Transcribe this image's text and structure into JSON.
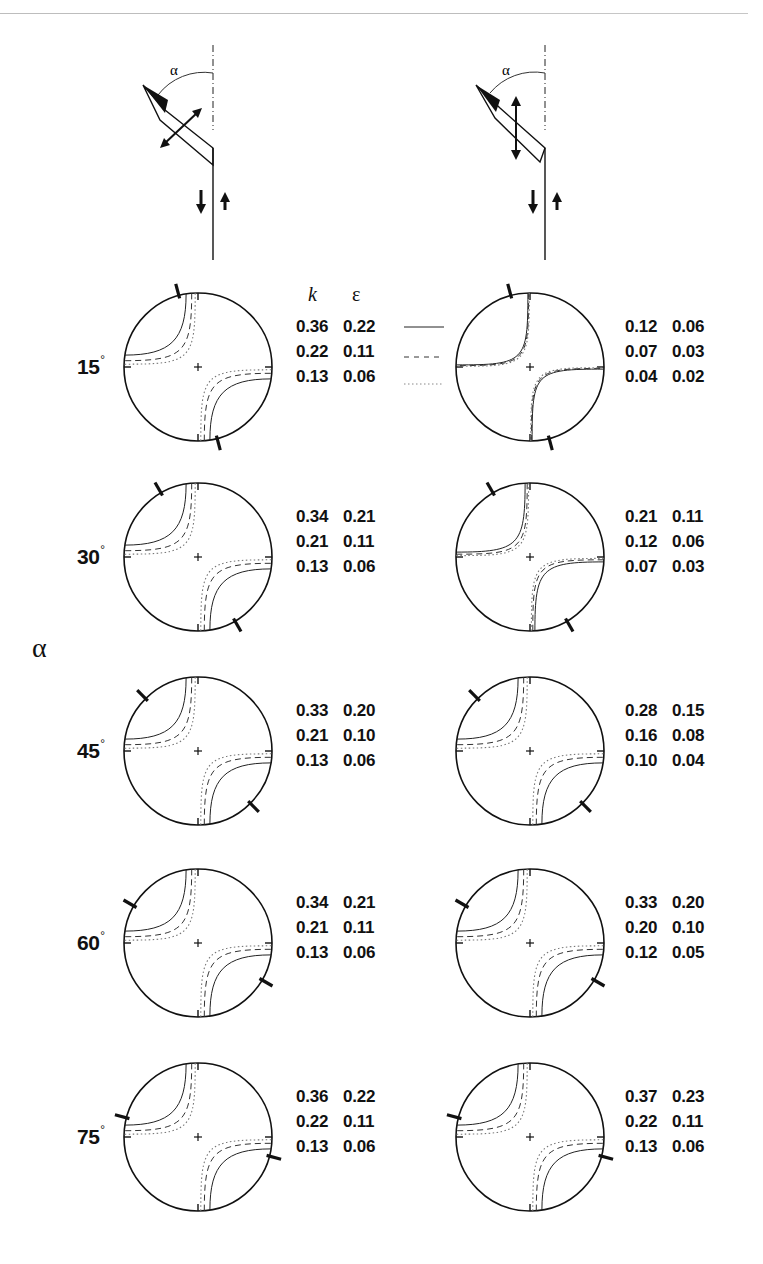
{
  "page": {
    "axis_label": "α",
    "column_headers": {
      "k": "k",
      "epsilon": "ε"
    },
    "legend": [
      {
        "style": "solid",
        "label": "solid line"
      },
      {
        "style": "dashed",
        "label": "dashed line"
      },
      {
        "style": "dotted",
        "label": "dotted line"
      }
    ]
  },
  "schematics": {
    "left": {
      "angle_symbol": "α",
      "description": "inclined fault segment with arrows perpendicular to segment (opening)",
      "arrow_mode": "perpendicular"
    },
    "right": {
      "angle_symbol": "α",
      "description": "inclined fault segment with vertical arrows",
      "arrow_mode": "vertical"
    }
  },
  "chart_data": {
    "type": "table",
    "title": "",
    "row_axis_label": "α",
    "columns": [
      "k",
      "ε"
    ],
    "line_styles": [
      "solid",
      "dashed",
      "dotted"
    ],
    "rows": [
      {
        "angle": "15°",
        "left": [
          [
            "0.36",
            "0.22"
          ],
          [
            "0.22",
            "0.11"
          ],
          [
            "0.13",
            "0.06"
          ]
        ],
        "right": [
          [
            "0.12",
            "0.06"
          ],
          [
            "0.07",
            "0.03"
          ],
          [
            "0.04",
            "0.02"
          ]
        ],
        "left_marker_deg": 15,
        "right_marker_deg": 15
      },
      {
        "angle": "30°",
        "left": [
          [
            "0.34",
            "0.21"
          ],
          [
            "0.21",
            "0.11"
          ],
          [
            "0.13",
            "0.06"
          ]
        ],
        "right": [
          [
            "0.21",
            "0.11"
          ],
          [
            "0.12",
            "0.06"
          ],
          [
            "0.07",
            "0.03"
          ]
        ],
        "left_marker_deg": 30,
        "right_marker_deg": 30
      },
      {
        "angle": "45°",
        "left": [
          [
            "0.33",
            "0.20"
          ],
          [
            "0.21",
            "0.10"
          ],
          [
            "0.13",
            "0.06"
          ]
        ],
        "right": [
          [
            "0.28",
            "0.15"
          ],
          [
            "0.16",
            "0.08"
          ],
          [
            "0.10",
            "0.04"
          ]
        ],
        "left_marker_deg": 45,
        "right_marker_deg": 45
      },
      {
        "angle": "60°",
        "left": [
          [
            "0.34",
            "0.21"
          ],
          [
            "0.21",
            "0.11"
          ],
          [
            "0.13",
            "0.06"
          ]
        ],
        "right": [
          [
            "0.33",
            "0.20"
          ],
          [
            "0.20",
            "0.10"
          ],
          [
            "0.12",
            "0.05"
          ]
        ],
        "left_marker_deg": 60,
        "right_marker_deg": 60
      },
      {
        "angle": "75°",
        "left": [
          [
            "0.36",
            "0.22"
          ],
          [
            "0.22",
            "0.11"
          ],
          [
            "0.13",
            "0.06"
          ]
        ],
        "right": [
          [
            "0.37",
            "0.23"
          ],
          [
            "0.22",
            "0.11"
          ],
          [
            "0.13",
            "0.06"
          ]
        ],
        "left_marker_deg": 75,
        "right_marker_deg": 75
      }
    ]
  }
}
